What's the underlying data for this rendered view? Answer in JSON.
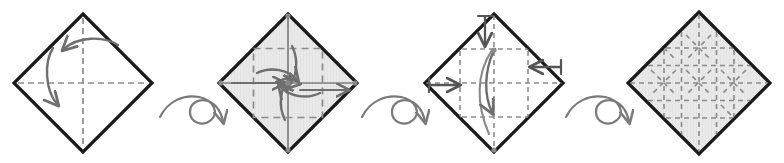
{
  "figure": {
    "title": "Origami crease-pattern folding sequence",
    "caption": "Four-step diamond folding sequence with turn-over symbols between steps",
    "background_color": "#ffffff",
    "width": 784,
    "height": 163
  },
  "style": {
    "outline_color": "#1a1a1a",
    "outline_width": 3.2,
    "crease_color": "#8c8c8c",
    "crease_width": 1.7,
    "crease_dash": "6 4",
    "fine_crease_dash": "5 4",
    "arrow_color": "#6e6e6e",
    "arrow_width": 2.4,
    "push_arrow_color": "#555555",
    "flip_symbol_color": "#7a7a7a",
    "flip_symbol_width": 2.2,
    "paper_fill": "#e8e8e8",
    "paper_fill_light": "#ececec",
    "dot_color": "#8a8a8a",
    "dot_radius": 2.6
  },
  "steps": [
    {
      "index": 1,
      "name": "step-1-diagonal-creases",
      "label": "Step 1",
      "description": "Square rotated 45 degrees with horizontal and vertical centre creases; fold arrows indicate folding the top-right edge left and the top-left edge down.",
      "center": {
        "x": 83,
        "y": 83
      },
      "radius": 69,
      "filled": false,
      "creases": [
        "vertical-center",
        "horizontal-center"
      ],
      "arrows": [
        "fold-left-arc",
        "fold-down-arc"
      ],
      "vertex_dots": []
    },
    {
      "index": 2,
      "name": "step-2-quarter-creases",
      "label": "Step 2",
      "description": "Shaded diamond with an inner dashed square of quarter creases and four pinwheel arrows radiating outward from the centre.",
      "center": {
        "x": 288,
        "y": 83
      },
      "radius": 69,
      "filled": true,
      "creases": [
        "vertical-center",
        "horizontal-center",
        "inner-square"
      ],
      "arrows": [
        "pinwheel-up",
        "pinwheel-right",
        "pinwheel-down",
        "pinwheel-left"
      ],
      "vertex_dots": [
        "top",
        "right",
        "bottom",
        "left"
      ]
    },
    {
      "index": 3,
      "name": "step-3-eighth-grid",
      "label": "Step 3",
      "description": "Diamond with a finer dashed grid; push arrows with cross-bar tails enter from the top, left and right, and a long curved arrow sweeps from the top centre down to the bottom vertex.",
      "center": {
        "x": 494,
        "y": 83
      },
      "radius": 69,
      "filled": false,
      "creases": [
        "grid-eighths"
      ],
      "arrows": [
        "push-top",
        "push-left",
        "push-right",
        "long-fold-down"
      ],
      "vertex_dots": [
        "top-center",
        "bottom"
      ]
    },
    {
      "index": 4,
      "name": "step-4-finished-crease-pattern",
      "label": "Step 4",
      "description": "Completed shaded crease pattern: full dashed grid with diagonal creases radiating from alternating intersections, forming a tessellation.",
      "center": {
        "x": 699,
        "y": 83
      },
      "radius": 71,
      "filled": true,
      "creases": [
        "grid-eighths",
        "diagonal-stars"
      ],
      "arrows": [],
      "vertex_dots": []
    }
  ],
  "connectors": [
    {
      "index": 1,
      "name": "turn-over-symbol-1",
      "symbol": "turn-over",
      "label": "Turn the paper over",
      "center": {
        "x": 190,
        "y": 112
      },
      "direction": "right"
    },
    {
      "index": 2,
      "name": "turn-over-symbol-2",
      "symbol": "turn-over",
      "label": "Turn the paper over",
      "center": {
        "x": 392,
        "y": 112
      },
      "direction": "right"
    },
    {
      "index": 3,
      "name": "turn-over-symbol-3",
      "symbol": "turn-over",
      "label": "Turn the paper over",
      "center": {
        "x": 596,
        "y": 112
      },
      "direction": "right"
    }
  ]
}
